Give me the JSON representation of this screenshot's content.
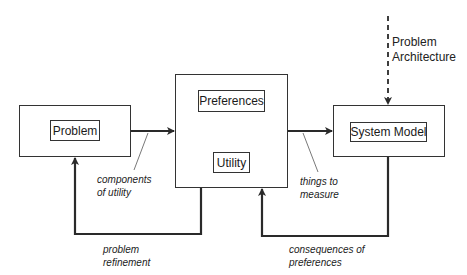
{
  "diagram": {
    "boxes": {
      "problem": {
        "label": "Problem"
      },
      "center": {
        "preferences": {
          "label": "Preferences"
        },
        "utility": {
          "label": "Utility"
        }
      },
      "system_model": {
        "label": "System Model"
      }
    },
    "external_input": {
      "line1": "Problem",
      "line2": "Architecture"
    },
    "edge_labels": {
      "components_of_utility": {
        "line1": "components",
        "line2": "of utility"
      },
      "things_to_measure": {
        "line1": "things to",
        "line2": "measure"
      },
      "problem_refinement": {
        "line1": "problem",
        "line2": "refinement"
      },
      "consequences_of_preferences": {
        "line1": "consequences of",
        "line2": "preferences"
      }
    },
    "colors": {
      "line": "#2a2a2a",
      "background": "#ffffff"
    }
  }
}
